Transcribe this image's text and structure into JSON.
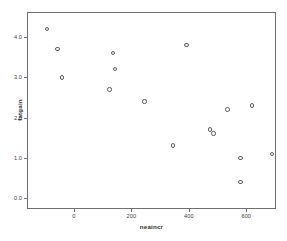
{
  "chart_data": {
    "type": "scatter",
    "title": "",
    "xlabel": "neaincr",
    "ylabel": "fatgain",
    "xlim": [
      -160,
      700
    ],
    "ylim": [
      -0.25,
      4.6
    ],
    "xticks": [
      0,
      200,
      400,
      600
    ],
    "xticklabels": [
      "0",
      "200",
      "400",
      "600"
    ],
    "yticks": [
      0.0,
      1.0,
      2.0,
      3.0,
      4.0
    ],
    "yticklabels": [
      "0.0",
      "1.0",
      "2.0",
      "3.0",
      "4.0"
    ],
    "grid": false,
    "legend": null,
    "marker": "open-circle",
    "marker_color": "#5d5d64",
    "frame_color": "#6e6e74",
    "background": "#ffffff",
    "n_points": 16,
    "points": [
      {
        "x": -94,
        "y": 4.2
      },
      {
        "x": -57,
        "y": 3.7
      },
      {
        "x": -42,
        "y": 3.0
      },
      {
        "x": 135,
        "y": 3.6
      },
      {
        "x": 143,
        "y": 3.2
      },
      {
        "x": 124,
        "y": 2.7
      },
      {
        "x": 245,
        "y": 2.4
      },
      {
        "x": 392,
        "y": 3.8
      },
      {
        "x": 345,
        "y": 1.3
      },
      {
        "x": 473,
        "y": 1.7
      },
      {
        "x": 486,
        "y": 1.6
      },
      {
        "x": 535,
        "y": 2.2
      },
      {
        "x": 580,
        "y": 1.0
      },
      {
        "x": 580,
        "y": 0.4
      },
      {
        "x": 620,
        "y": 2.3
      },
      {
        "x": 690,
        "y": 1.1
      }
    ]
  }
}
